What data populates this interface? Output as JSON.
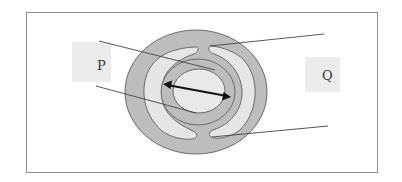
{
  "diagram": {
    "type": "cross-section",
    "labels": {
      "p": "P",
      "q": "Q"
    },
    "colors": {
      "frame": "#8c8c8c",
      "outer_tissue": "#bdbdbd",
      "chamber": "#e6e6e6",
      "center": "#e9e9e9",
      "outline": "#6a6a6a",
      "label_box": "#ececec",
      "arrow": "#111111",
      "pointer_line": "#444444"
    },
    "arrow": {
      "direction": "double-headed"
    }
  }
}
